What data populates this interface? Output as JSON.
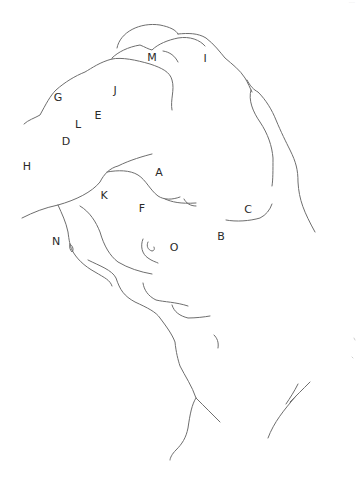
{
  "diagram": {
    "type": "hand-drawn line sketch with letter labels",
    "background": "#ffffff",
    "stroke_color": "#6e6e6e",
    "labels": [
      {
        "id": "A",
        "text": "A",
        "x": 159,
        "y": 172
      },
      {
        "id": "B",
        "text": "B",
        "x": 221,
        "y": 236
      },
      {
        "id": "C",
        "text": "C",
        "x": 248,
        "y": 209
      },
      {
        "id": "D",
        "text": "D",
        "x": 66,
        "y": 141
      },
      {
        "id": "E",
        "text": "E",
        "x": 98,
        "y": 115
      },
      {
        "id": "F",
        "text": "F",
        "x": 142,
        "y": 208
      },
      {
        "id": "G",
        "text": "G",
        "x": 58,
        "y": 97
      },
      {
        "id": "H",
        "text": "H",
        "x": 27,
        "y": 166
      },
      {
        "id": "I",
        "text": "I",
        "x": 205,
        "y": 58
      },
      {
        "id": "J",
        "text": "J",
        "x": 115,
        "y": 90
      },
      {
        "id": "K",
        "text": "K",
        "x": 104,
        "y": 195
      },
      {
        "id": "L",
        "text": "L",
        "x": 78,
        "y": 124
      },
      {
        "id": "M",
        "text": "M",
        "x": 152,
        "y": 57
      },
      {
        "id": "N",
        "text": "N",
        "x": 56,
        "y": 241
      },
      {
        "id": "O",
        "text": "O",
        "x": 174,
        "y": 247
      }
    ]
  }
}
